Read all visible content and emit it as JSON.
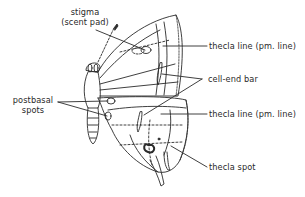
{
  "diagram": {
    "labels": {
      "stigma": "stigma",
      "stigma_sub": "(scent pad)",
      "postbasal": "postbasal",
      "postbasal_sub": "spots",
      "thecla_line_upper": "thecla line (pm. line)",
      "cell_end_bar": "cell-end bar",
      "thecla_line_lower": "thecla line (pm. line)",
      "thecla_spot": "thecla spot"
    },
    "colors": {
      "ink": "#2a2a2a",
      "background": "#ffffff"
    }
  }
}
